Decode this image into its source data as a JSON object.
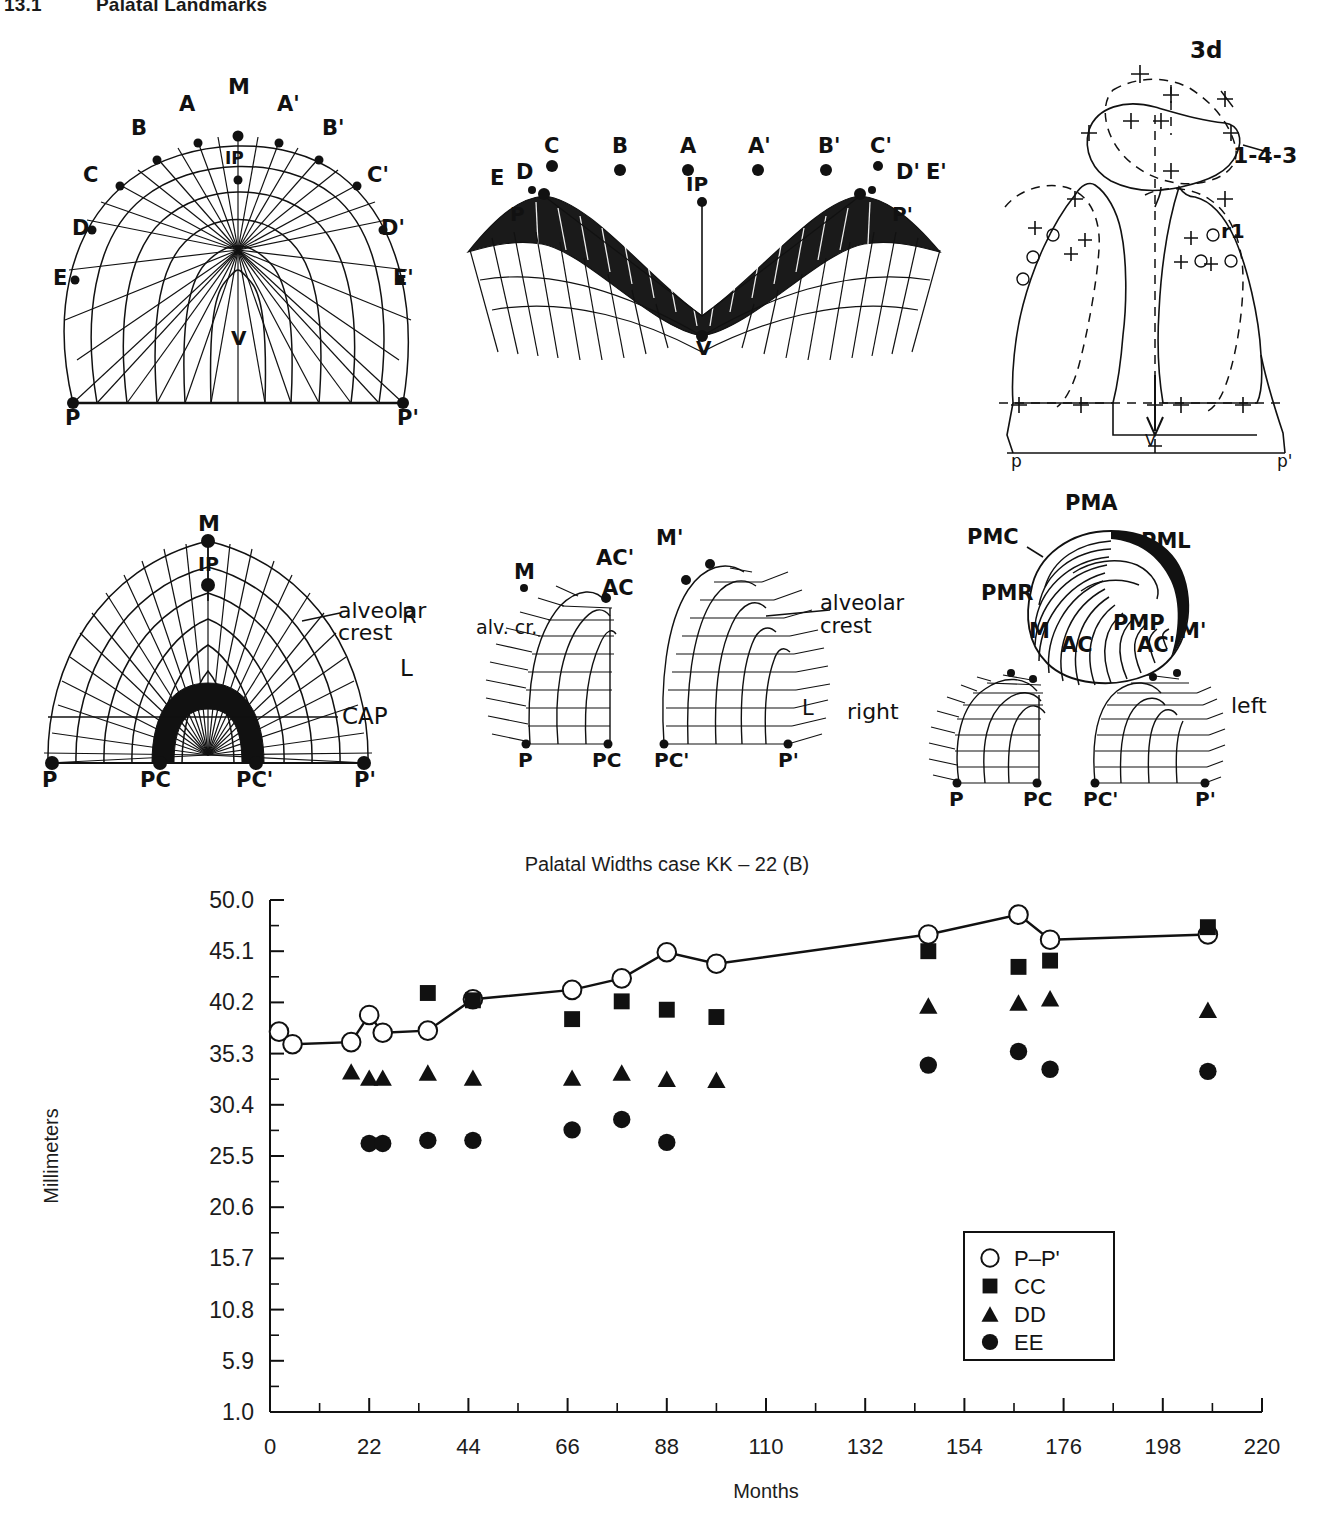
{
  "header": {
    "number": "13.1",
    "title": "Palatal Landmarks"
  },
  "figures": {
    "occlusal_landmarks": {
      "name": "occlusal-palate-landmarks",
      "labels": [
        "M",
        "A",
        "A'",
        "B",
        "B'",
        "C",
        "C'",
        "D",
        "D'",
        "E",
        "E'",
        "IP",
        "V",
        "P",
        "P'"
      ]
    },
    "frontal_landmarks": {
      "name": "frontal-palate-landmarks",
      "labels": [
        "E",
        "D",
        "C",
        "B",
        "A",
        "A'",
        "B'",
        "C'",
        "D'",
        "E'",
        "P",
        "P'",
        "IP",
        "V"
      ]
    },
    "cleft_tracing": {
      "name": "cleft-palate-tracing",
      "labels": [
        "3d",
        "1-4-3",
        "r1",
        "p",
        "p'",
        "V"
      ]
    },
    "cap_diagram": {
      "name": "palate-cap-diagram",
      "labels": [
        "M",
        "IP",
        "alveolar crest",
        "L",
        "CAP",
        "P",
        "PC",
        "PC'",
        "P'"
      ]
    },
    "bilateral_cleft": {
      "name": "bilateral-cleft-segments",
      "labels": [
        "M",
        "M'",
        "AC",
        "AC'",
        "alv. cr.",
        "alveolar crest",
        "R",
        "L",
        "P",
        "PC",
        "PC'",
        "P'"
      ]
    },
    "premaxilla": {
      "name": "premaxilla-segments",
      "labels": [
        "PMA",
        "PMC",
        "PML",
        "PMR",
        "PMP",
        "M",
        "M'",
        "AC",
        "AC'",
        "right",
        "left",
        "P",
        "PC",
        "PC'",
        "P'"
      ]
    }
  },
  "chart_data": {
    "type": "scatter",
    "title": "Palatal Widths case KK – 22 (B)",
    "xlabel": "Months",
    "ylabel": "Millimeters",
    "xlim": [
      0,
      220
    ],
    "ylim": [
      1.0,
      50.0
    ],
    "xticks": [
      0,
      22,
      44,
      66,
      88,
      110,
      132,
      154,
      176,
      198,
      220
    ],
    "xtick_labels": [
      "0",
      "22",
      "44",
      "66",
      "88",
      "110",
      "132",
      "154",
      "176",
      "198",
      "220"
    ],
    "yticks": [
      1.0,
      5.9,
      10.8,
      15.7,
      20.6,
      25.5,
      30.4,
      35.3,
      40.2,
      45.1,
      50.0
    ],
    "ytick_labels": [
      "1.0",
      "5.9",
      "10.8",
      "15.7",
      "20.6",
      "25.5",
      "30.4",
      "35.3",
      "40.2",
      "45.1",
      "50.0"
    ],
    "grid": false,
    "minor_ticks": true,
    "legend_position": "lower-right",
    "series": [
      {
        "name": "P–P'",
        "marker": "open-circle",
        "line": true,
        "points": [
          {
            "x": 2,
            "y": 37.4
          },
          {
            "x": 5,
            "y": 36.2
          },
          {
            "x": 18,
            "y": 36.4
          },
          {
            "x": 22,
            "y": 39.0
          },
          {
            "x": 25,
            "y": 37.3
          },
          {
            "x": 35,
            "y": 37.5
          },
          {
            "x": 45,
            "y": 40.5
          },
          {
            "x": 67,
            "y": 41.4
          },
          {
            "x": 78,
            "y": 42.5
          },
          {
            "x": 88,
            "y": 45.0
          },
          {
            "x": 99,
            "y": 43.9
          },
          {
            "x": 146,
            "y": 46.7
          },
          {
            "x": 166,
            "y": 48.6
          },
          {
            "x": 173,
            "y": 46.2
          },
          {
            "x": 208,
            "y": 46.7
          }
        ]
      },
      {
        "name": "CC",
        "marker": "filled-square",
        "line": false,
        "points": [
          {
            "x": 35,
            "y": 41.1
          },
          {
            "x": 45,
            "y": 40.4
          },
          {
            "x": 67,
            "y": 38.6
          },
          {
            "x": 78,
            "y": 40.3
          },
          {
            "x": 88,
            "y": 39.5
          },
          {
            "x": 99,
            "y": 38.8
          },
          {
            "x": 146,
            "y": 45.1
          },
          {
            "x": 166,
            "y": 43.6
          },
          {
            "x": 173,
            "y": 44.2
          },
          {
            "x": 208,
            "y": 47.4
          }
        ]
      },
      {
        "name": "DD",
        "marker": "filled-triangle",
        "line": false,
        "points": [
          {
            "x": 18,
            "y": 33.6
          },
          {
            "x": 22,
            "y": 33.0
          },
          {
            "x": 25,
            "y": 33.0
          },
          {
            "x": 35,
            "y": 33.5
          },
          {
            "x": 45,
            "y": 33.0
          },
          {
            "x": 67,
            "y": 33.0
          },
          {
            "x": 78,
            "y": 33.5
          },
          {
            "x": 88,
            "y": 32.9
          },
          {
            "x": 99,
            "y": 32.8
          },
          {
            "x": 146,
            "y": 39.9
          },
          {
            "x": 166,
            "y": 40.2
          },
          {
            "x": 173,
            "y": 40.6
          },
          {
            "x": 208,
            "y": 39.5
          }
        ]
      },
      {
        "name": "EE",
        "marker": "filled-circle",
        "line": false,
        "points": [
          {
            "x": 22,
            "y": 26.7
          },
          {
            "x": 25,
            "y": 26.7
          },
          {
            "x": 35,
            "y": 27.0
          },
          {
            "x": 45,
            "y": 27.0
          },
          {
            "x": 67,
            "y": 28.0
          },
          {
            "x": 78,
            "y": 29.0
          },
          {
            "x": 88,
            "y": 26.8
          },
          {
            "x": 146,
            "y": 34.2
          },
          {
            "x": 166,
            "y": 35.5
          },
          {
            "x": 173,
            "y": 33.8
          },
          {
            "x": 208,
            "y": 33.6
          }
        ]
      }
    ],
    "legend": [
      {
        "label": "P–P'",
        "marker": "open-circle"
      },
      {
        "label": "CC",
        "marker": "filled-square"
      },
      {
        "label": "DD",
        "marker": "filled-triangle"
      },
      {
        "label": "EE",
        "marker": "filled-circle"
      }
    ]
  }
}
